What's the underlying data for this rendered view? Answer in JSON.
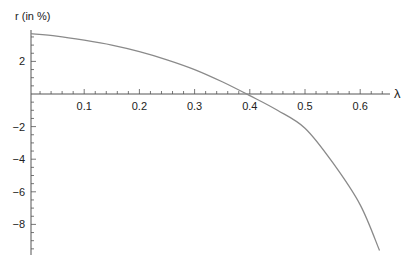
{
  "chart_data": {
    "type": "line",
    "title": "",
    "xlabel": "λ",
    "ylabel": "r (in %)",
    "xlim": [
      0,
      0.65
    ],
    "ylim": [
      -9.8,
      3.8
    ],
    "grid": false,
    "legend": null,
    "x_ticks": [
      0.1,
      0.2,
      0.3,
      0.4,
      0.5,
      0.6
    ],
    "x_tick_labels": [
      "0.1",
      "0.2",
      "0.3",
      "0.4",
      "0.5",
      "0.6"
    ],
    "y_ticks": [
      2,
      -2,
      -4,
      -6,
      -8
    ],
    "y_tick_labels": [
      "2",
      "-2",
      "-4",
      "-6",
      "-8"
    ],
    "series": [
      {
        "name": "r(λ)",
        "color": "#8a8a8a",
        "x": [
          0,
          0.05,
          0.1,
          0.15,
          0.2,
          0.25,
          0.3,
          0.35,
          0.4,
          0.45,
          0.5,
          0.55,
          0.6,
          0.635
        ],
        "y": [
          3.7,
          3.55,
          3.3,
          3.0,
          2.6,
          2.1,
          1.5,
          0.75,
          -0.1,
          -1.0,
          -2.1,
          -4.2,
          -6.8,
          -9.6
        ]
      }
    ],
    "zero_crossing": 0.395
  }
}
